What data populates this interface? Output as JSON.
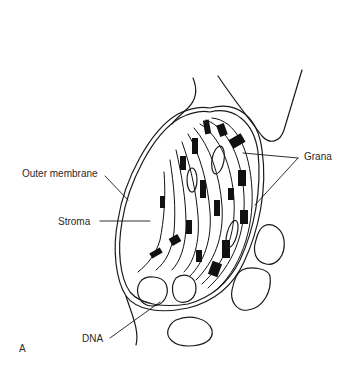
{
  "figure": {
    "panel_label": "A",
    "labels": {
      "outer_membrane": "Outer membrane",
      "stroma": "Stroma",
      "grana": "Grana",
      "dna": "DNA"
    },
    "colors": {
      "ink": "#1a1a1a",
      "background": "#ffffff",
      "text": "#2a2a2a"
    }
  }
}
